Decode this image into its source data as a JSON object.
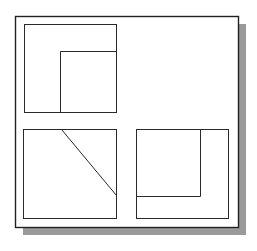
{
  "diagram": {
    "type": "orthographic-projection",
    "colors": {
      "background": "#ffffff",
      "line": "#2a2a2a",
      "frame": "#222222",
      "shadow": "#9a9a9a"
    },
    "frame": {
      "x": 15,
      "y": 16,
      "width": 223,
      "height": 211
    },
    "shadow": {
      "offset_x": 8,
      "offset_y": 8
    },
    "views": [
      {
        "name": "top-left-view",
        "rect": {
          "x": 24,
          "y": 24,
          "width": 92,
          "height": 88
        },
        "lines": [
          {
            "x1": 60,
            "y1": 51,
            "x2": 60,
            "y2": 112
          },
          {
            "x1": 60,
            "y1": 51,
            "x2": 116,
            "y2": 51
          }
        ]
      },
      {
        "name": "bottom-left-view",
        "rect": {
          "x": 23,
          "y": 129,
          "width": 93,
          "height": 89
        },
        "lines": [
          {
            "x1": 61,
            "y1": 129,
            "x2": 116,
            "y2": 195
          }
        ]
      },
      {
        "name": "bottom-right-view",
        "rect": {
          "x": 136,
          "y": 129,
          "width": 92,
          "height": 89
        },
        "lines": [
          {
            "x1": 200,
            "y1": 129,
            "x2": 200,
            "y2": 196
          },
          {
            "x1": 136,
            "y1": 196,
            "x2": 200,
            "y2": 196
          }
        ]
      }
    ]
  }
}
